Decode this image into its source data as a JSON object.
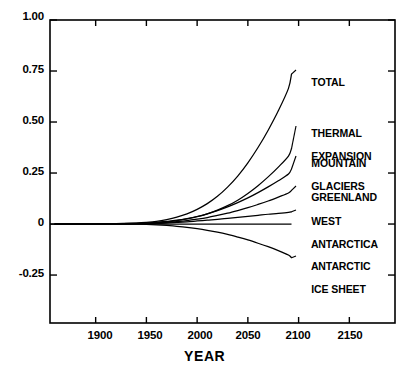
{
  "chart_data": {
    "type": "line",
    "title": "",
    "xlabel": "YEAR",
    "ylabel": "",
    "xlim": [
      1855,
      2195
    ],
    "ylim": [
      -0.485,
      1.0
    ],
    "grid": false,
    "legend_position": "right-inline-labels",
    "xticks": [
      1900,
      1950,
      2000,
      2050,
      2100,
      2150
    ],
    "xtick_labels": [
      "1900",
      "1950",
      "2000",
      "2050",
      "2100",
      "2150"
    ],
    "yticks": [
      1.0,
      0.75,
      0.5,
      0.25,
      0.0,
      -0.25
    ],
    "ytick_labels": [
      "1.00",
      "0.75",
      "0.50",
      "0.25",
      "0",
      "-0.25"
    ],
    "line_color": "#000000",
    "x": [
      1860,
      1880,
      1900,
      1920,
      1940,
      1950,
      1960,
      1970,
      1980,
      1990,
      2000,
      2010,
      2020,
      2030,
      2040,
      2050,
      2060,
      2070,
      2080,
      2090,
      2093
    ],
    "series": [
      {
        "name": "TOTAL",
        "label": "TOTAL",
        "values": [
          0,
          0,
          0,
          0.002,
          0.005,
          0.008,
          0.013,
          0.022,
          0.034,
          0.05,
          0.072,
          0.1,
          0.136,
          0.181,
          0.235,
          0.3,
          0.375,
          0.46,
          0.555,
          0.665,
          0.735
        ]
      },
      {
        "name": "THERMAL EXPANSION",
        "label": "THERMAL\nEXPANSION",
        "values": [
          0,
          0,
          0,
          0.001,
          0.003,
          0.004,
          0.007,
          0.011,
          0.017,
          0.025,
          0.036,
          0.05,
          0.068,
          0.09,
          0.117,
          0.15,
          0.188,
          0.231,
          0.279,
          0.333,
          0.37
        ]
      },
      {
        "name": "MOUNTAIN GLACIERS",
        "label": "MOUNTAIN\nGLACIERS",
        "values": [
          0,
          0,
          0,
          0.001,
          0.003,
          0.005,
          0.008,
          0.013,
          0.019,
          0.027,
          0.037,
          0.05,
          0.066,
          0.084,
          0.105,
          0.128,
          0.154,
          0.182,
          0.212,
          0.245,
          0.27
        ]
      },
      {
        "name": "GREENLAND",
        "label": "GREENLAND",
        "values": [
          0,
          0,
          0,
          0.001,
          0.002,
          0.003,
          0.005,
          0.008,
          0.012,
          0.017,
          0.024,
          0.032,
          0.042,
          0.053,
          0.066,
          0.08,
          0.096,
          0.113,
          0.132,
          0.152,
          0.165
        ]
      },
      {
        "name": "WEST ANTARCTICA",
        "label": "WEST\nANTARCTICA",
        "values": [
          0,
          0,
          0,
          0.0005,
          0.001,
          0.002,
          0.003,
          0.005,
          0.008,
          0.011,
          0.015,
          0.019,
          0.023,
          0.028,
          0.033,
          0.038,
          0.043,
          0.048,
          0.052,
          0.057,
          0.06
        ]
      },
      {
        "name": "ANTARCTIC ICE SHEET",
        "label": "ANTARCTIC\nICE SHEET",
        "values": [
          0,
          0,
          0,
          -0.0005,
          -0.001,
          -0.002,
          -0.004,
          -0.007,
          -0.011,
          -0.016,
          -0.023,
          -0.031,
          -0.04,
          -0.051,
          -0.064,
          -0.078,
          -0.094,
          -0.111,
          -0.13,
          -0.152,
          -0.165
        ]
      }
    ],
    "annotations": [
      {
        "text": "TOTAL",
        "x": 2100,
        "y": 0.745
      },
      {
        "text": "THERMAL EXPANSION",
        "x": 2100,
        "y": 0.435
      },
      {
        "text": "MOUNTAIN GLACIERS",
        "x": 2100,
        "y": 0.305
      },
      {
        "text": "GREENLAND",
        "x": 2100,
        "y": 0.185
      },
      {
        "text": "WEST ANTARCTICA",
        "x": 2100,
        "y": 0.08
      },
      {
        "text": "ANTARCTIC ICE SHEET",
        "x": 2100,
        "y": -0.14
      }
    ]
  },
  "labels": {
    "y": [
      "1.00",
      "0.75",
      "0.50",
      "0.25",
      "0",
      "-0.25"
    ],
    "x": [
      "1900",
      "1950",
      "2000",
      "2050",
      "2100",
      "2150"
    ],
    "axis_title_x": "YEAR",
    "curve_total": "TOTAL",
    "curve_thermal_1": "THERMAL",
    "curve_thermal_2": "EXPANSION",
    "curve_mountain_1": "MOUNTAIN",
    "curve_mountain_2": "GLACIERS",
    "curve_greenland": "GREENLAND",
    "curve_west_1": "WEST",
    "curve_west_2": "ANTARCTICA",
    "curve_antarctic_1": "ANTARCTIC",
    "curve_antarctic_2": "ICE SHEET"
  }
}
